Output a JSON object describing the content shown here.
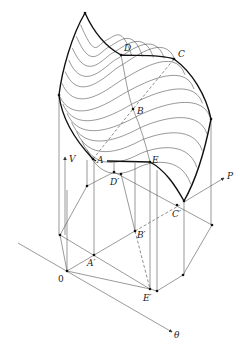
{
  "figure": {
    "axes": {
      "vertical": "V",
      "right": "P",
      "front": "θ",
      "origin": "0"
    },
    "surface_points": {
      "A": "A",
      "B": "B",
      "C": "C",
      "D": "D",
      "E": "E"
    },
    "projected_points": {
      "A": "A′",
      "B": "B′",
      "C": "C′",
      "D": "D′",
      "E": "E′"
    }
  }
}
